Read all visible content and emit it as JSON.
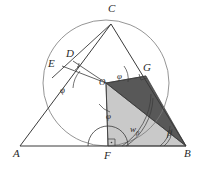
{
  "figure": {
    "type": "geometry-diagram",
    "background_color": "#ffffff",
    "stroke_color": "#3a3a3a",
    "fill_dark": "#585858",
    "fill_light": "#c9c9c9"
  },
  "vertices": {
    "A": {
      "label": "A",
      "x": 20,
      "y": 146
    },
    "B": {
      "label": "B",
      "x": 186,
      "y": 146
    },
    "C": {
      "label": "C",
      "x": 111,
      "y": 24
    },
    "D": {
      "label": "D",
      "x": 73,
      "y": 61
    },
    "E": {
      "label": "E",
      "x": 60,
      "y": 68
    },
    "F": {
      "label": "F",
      "x": 108,
      "y": 146
    },
    "G": {
      "label": "G",
      "x": 146,
      "y": 76
    },
    "O": {
      "label": "O",
      "x": 106,
      "y": 83
    }
  },
  "vertex_labels": [
    {
      "name": "A",
      "text": "A",
      "left": 13,
      "top": 148
    },
    {
      "name": "B",
      "text": "B",
      "left": 184,
      "top": 148
    },
    {
      "name": "C",
      "text": "C",
      "left": 108,
      "top": 3
    },
    {
      "name": "D",
      "text": "D",
      "left": 66,
      "top": 48
    },
    {
      "name": "E",
      "text": "E",
      "left": 48,
      "top": 58
    },
    {
      "name": "F",
      "text": "F",
      "left": 104,
      "top": 150
    },
    {
      "name": "G",
      "text": "G",
      "left": 143,
      "top": 62
    },
    {
      "name": "O",
      "text": "O",
      "left": 99,
      "top": 78
    }
  ],
  "angle_labels": [
    {
      "name": "phi-at-E",
      "text": "φ",
      "left": 60,
      "top": 86
    },
    {
      "name": "phi-at-G",
      "text": "φ",
      "left": 117,
      "top": 74
    },
    {
      "name": "phi-at-F",
      "text": "φ",
      "left": 106,
      "top": 113
    },
    {
      "name": "w-beta",
      "text": "w",
      "sub": "β",
      "left": 130,
      "top": 126
    },
    {
      "name": "beta",
      "text": "β",
      "left": 167,
      "top": 130
    }
  ],
  "shaded_regions": [
    {
      "name": "triangle-OGB",
      "points": "106,83 146,76 186,146",
      "fill": "#585858"
    },
    {
      "name": "triangle-OFB",
      "points": "106,83 108,146 186,146",
      "fill": "#c9c9c9"
    }
  ],
  "incircle": {
    "cx": 106,
    "cy": 83,
    "r": 63
  }
}
